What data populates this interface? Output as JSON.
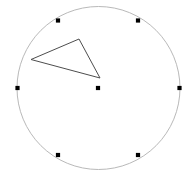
{
  "figure": {
    "width": 192,
    "height": 178,
    "background_color": "#ffffff"
  },
  "chart_data": {
    "type": "scatter",
    "title": "",
    "subtitle": "",
    "xlabel": "",
    "ylabel": "",
    "xlim": [
      0,
      192
    ],
    "ylim": [
      0,
      178
    ],
    "grid": false,
    "legend": null,
    "annotations": [],
    "tick_labels": {
      "x": [],
      "y": []
    },
    "circle": {
      "label": "outer-circle",
      "center_x": 98.5,
      "center_y": 88,
      "radius": 81.5,
      "stroke_color": "#b9b9b9",
      "stroke_width": 1,
      "fill": "none"
    },
    "points": [
      {
        "label": "center-point",
        "x": 98,
        "y": 88,
        "size": 4.2,
        "color": "#000000",
        "on_circle": false
      },
      {
        "label": "boundary-point-upper-left",
        "x": 58,
        "y": 20.5,
        "size": 4.2,
        "color": "#000000",
        "on_circle": true
      },
      {
        "label": "boundary-point-upper-right",
        "x": 138,
        "y": 20.5,
        "size": 4.2,
        "color": "#000000",
        "on_circle": true
      },
      {
        "label": "boundary-point-left",
        "x": 17.5,
        "y": 88,
        "size": 4.2,
        "color": "#000000",
        "on_circle": true
      },
      {
        "label": "boundary-point-right",
        "x": 179.5,
        "y": 88,
        "size": 4.2,
        "color": "#000000",
        "on_circle": true
      },
      {
        "label": "boundary-point-lower-left",
        "x": 58,
        "y": 155,
        "size": 4.2,
        "color": "#000000",
        "on_circle": true
      },
      {
        "label": "boundary-point-lower-right",
        "x": 138,
        "y": 155,
        "size": 4.2,
        "color": "#000000",
        "on_circle": true
      }
    ],
    "polygons": [
      {
        "label": "triangle",
        "vertices": [
          {
            "x": 31,
            "y": 59.5
          },
          {
            "x": 79,
            "y": 39
          },
          {
            "x": 100,
            "y": 78
          }
        ],
        "stroke_color": "#4d4d4d",
        "stroke_width": 1,
        "fill": "none"
      }
    ]
  }
}
